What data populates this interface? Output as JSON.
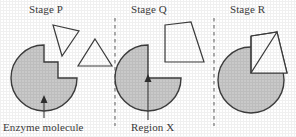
{
  "diagram": {
    "title_absent": true,
    "panels": [
      {
        "id": "p",
        "title": "Stage P",
        "caption": "Enzyme molecule",
        "enzyme_shape": "circle-with-wedge-notch",
        "substrates": [
          "triangle-tilted",
          "triangle-upright"
        ]
      },
      {
        "id": "q",
        "title": "Stage Q",
        "caption": "Region X",
        "enzyme_shape": "circle-with-quarter-notch",
        "substrates": [
          "quadrilateral"
        ]
      },
      {
        "id": "r",
        "title": "Stage R",
        "caption": "",
        "enzyme_shape": "circle-full",
        "substrates": [
          "quadrilateral-with-triangle-bound"
        ]
      }
    ],
    "colors": {
      "enzyme_fill": "#c9c9c9",
      "outline": "#3d3d3d",
      "substrate_fill": "#ffffff",
      "divider": "#6e6e6e",
      "text": "#3a3a3a",
      "background": "#ffffff"
    },
    "dividers": [
      {
        "name": "divider-p-q",
        "x": 115
      },
      {
        "name": "divider-q-r",
        "x": 214
      }
    ],
    "pointers": [
      {
        "name": "enzyme-pointer",
        "label": "Enzyme molecule"
      },
      {
        "name": "region-x-pointer",
        "label": "Region X"
      }
    ]
  }
}
